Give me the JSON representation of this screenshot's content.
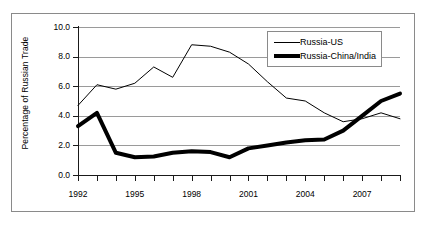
{
  "chart_data": {
    "type": "line",
    "title": "",
    "subtitle": "",
    "xlabel": "",
    "ylabel": "Percentage of Russian Trade",
    "xlim": [
      1992,
      2009
    ],
    "ylim": [
      0.0,
      10.0
    ],
    "y_ticks": [
      "0.0",
      "2.0",
      "4.0",
      "6.0",
      "8.0",
      "10.0"
    ],
    "y_tick_values": [
      0.0,
      2.0,
      4.0,
      6.0,
      8.0,
      10.0
    ],
    "x_ticks_all": [
      1992,
      1993,
      1994,
      1995,
      1996,
      1997,
      1998,
      1999,
      2000,
      2001,
      2002,
      2003,
      2004,
      2005,
      2006,
      2007,
      2008,
      2009
    ],
    "x_tick_labels": [
      "1992",
      "1995",
      "1998",
      "2001",
      "2004",
      "2007"
    ],
    "x_tick_label_values": [
      1992,
      1995,
      1998,
      2001,
      2004,
      2007
    ],
    "grid": "horizontal",
    "legend_position": "top-right-inside",
    "x": [
      1992,
      1993,
      1994,
      1995,
      1996,
      1997,
      1998,
      1999,
      2000,
      2001,
      2002,
      2003,
      2004,
      2005,
      2006,
      2007,
      2008,
      2009
    ],
    "series": [
      {
        "name": "Russia-US",
        "style": "thin",
        "color": "#000000",
        "values": [
          4.7,
          6.1,
          5.8,
          6.2,
          7.3,
          6.6,
          8.8,
          8.7,
          8.3,
          7.5,
          6.3,
          5.2,
          5.0,
          4.2,
          3.6,
          3.8,
          4.2,
          3.8
        ]
      },
      {
        "name": "Russia-China/India",
        "style": "thick",
        "color": "#000000",
        "values": [
          3.3,
          4.2,
          1.5,
          1.2,
          1.25,
          1.5,
          1.6,
          1.55,
          1.2,
          1.8,
          2.0,
          2.2,
          2.35,
          2.4,
          3.0,
          4.0,
          5.0,
          5.5
        ]
      }
    ]
  },
  "legend": {
    "items": [
      {
        "label": "Russia-US",
        "style": "thin"
      },
      {
        "label": "Russia-China/India",
        "style": "thick"
      }
    ]
  },
  "axes": {
    "y_title": "Percentage of Russian Trade"
  }
}
